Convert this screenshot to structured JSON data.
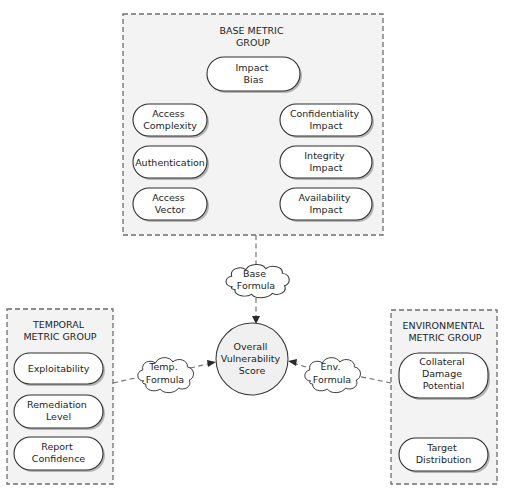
{
  "diagram": {
    "base_group": {
      "title": [
        "BASE METRIC",
        "GROUP"
      ],
      "metrics": [
        {
          "id": "impact-bias",
          "lines": [
            "Impact",
            "Bias"
          ]
        },
        {
          "id": "access-complexity",
          "lines": [
            "Access",
            "Complexity"
          ]
        },
        {
          "id": "authentication",
          "lines": [
            "Authentication"
          ]
        },
        {
          "id": "access-vector",
          "lines": [
            "Access",
            "Vector"
          ]
        },
        {
          "id": "confidentiality-impact",
          "lines": [
            "Confidentiality",
            "Impact"
          ]
        },
        {
          "id": "integrity-impact",
          "lines": [
            "Integrity",
            "Impact"
          ]
        },
        {
          "id": "availability-impact",
          "lines": [
            "Availability",
            "Impact"
          ]
        }
      ]
    },
    "temporal_group": {
      "title": [
        "TEMPORAL",
        "METRIC GROUP"
      ],
      "metrics": [
        {
          "id": "exploitability",
          "lines": [
            "Exploitability"
          ]
        },
        {
          "id": "remediation-level",
          "lines": [
            "Remediation",
            "Level"
          ]
        },
        {
          "id": "report-confidence",
          "lines": [
            "Report",
            "Confidence"
          ]
        }
      ]
    },
    "environmental_group": {
      "title": [
        "ENVIRONMENTAL",
        "METRIC GROUP"
      ],
      "metrics": [
        {
          "id": "collateral-damage-potential",
          "lines": [
            "Collateral",
            "Damage",
            "Potential"
          ]
        },
        {
          "id": "target-distribution",
          "lines": [
            "Target",
            "Distribution"
          ]
        }
      ]
    },
    "formulas": {
      "base": [
        "Base",
        "Formula"
      ],
      "temporal": [
        "Temp.",
        "Formula"
      ],
      "environmental": [
        "Env.",
        "Formula"
      ]
    },
    "score": [
      "Overall",
      "Vulnerability",
      "Score"
    ]
  }
}
